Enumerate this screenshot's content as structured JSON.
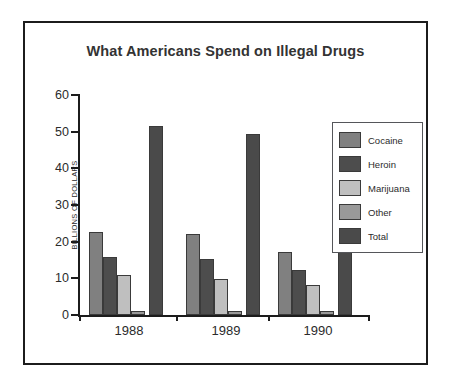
{
  "chart_data": {
    "type": "bar",
    "title": "What Americans Spend on Illegal Drugs",
    "xlabel": "",
    "ylabel": "BILLIONS OF DOLLARS",
    "categories": [
      "1988",
      "1989",
      "1990"
    ],
    "ylim": [
      0,
      60
    ],
    "yticks": [
      0,
      10,
      20,
      30,
      40,
      50,
      60
    ],
    "ytick_labels": [
      "0",
      "10",
      "20",
      "30",
      "40",
      "50",
      "60"
    ],
    "grid": false,
    "legend_position": "right",
    "series": [
      {
        "name": "Cocaine",
        "color": "#808080",
        "values": [
          22.7,
          22.2,
          17.3
        ]
      },
      {
        "name": "Heroin",
        "color": "#4d4d4d",
        "values": [
          15.8,
          15.4,
          12.2
        ]
      },
      {
        "name": "Marijuana",
        "color": "#bfbfbf",
        "values": [
          11.0,
          9.7,
          8.3
        ]
      },
      {
        "name": "Other",
        "color": "#999999",
        "values": [
          1.0,
          1.0,
          1.0
        ]
      },
      {
        "name": "Total",
        "color": "#4a4a4a",
        "values": [
          51.5,
          49.5,
          40.0
        ]
      }
    ]
  },
  "figure": {
    "border_color": "#1c1c1c",
    "background": "#ffffff",
    "axis_color": "#1c1c1c",
    "text_color": "#2b2b2b",
    "title_color": "#333333"
  }
}
